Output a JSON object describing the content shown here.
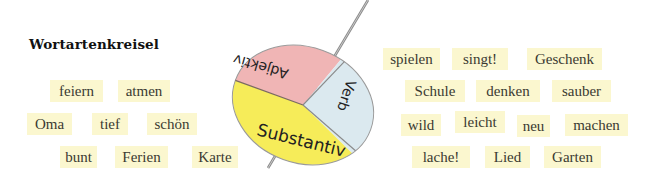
{
  "title": "Wortartenkreisel",
  "spinner": {
    "segments": [
      {
        "label": "Adjektiv",
        "color": "#f0b5b5"
      },
      {
        "label": "Verb",
        "color": "#dbe9ef"
      },
      {
        "label": "Substantiv",
        "color": "#f6ec59"
      }
    ]
  },
  "left_words": [
    {
      "text": "feiern"
    },
    {
      "text": "atmen"
    },
    {
      "text": "Oma"
    },
    {
      "text": "tief"
    },
    {
      "text": "schön"
    },
    {
      "text": "bunt"
    },
    {
      "text": "Ferien"
    },
    {
      "text": "Karte"
    }
  ],
  "right_words": [
    {
      "text": "spielen"
    },
    {
      "text": "singt!"
    },
    {
      "text": "Geschenk"
    },
    {
      "text": "Schule"
    },
    {
      "text": "denken"
    },
    {
      "text": "sauber"
    },
    {
      "text": "wild"
    },
    {
      "text": "leicht"
    },
    {
      "text": "neu"
    },
    {
      "text": "machen"
    },
    {
      "text": "lache!"
    },
    {
      "text": "Lied"
    },
    {
      "text": "Garten"
    }
  ],
  "colors": {
    "chip_bg": "#fbf7cf",
    "adjektiv": "#f0b5b5",
    "verb": "#dbe9ef",
    "substantiv": "#f6ec59"
  }
}
